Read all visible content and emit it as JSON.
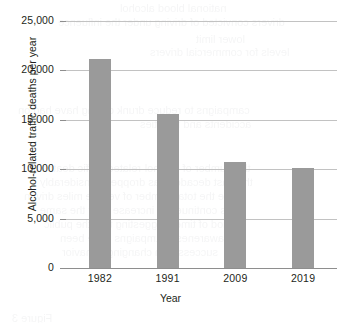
{
  "chart_data": {
    "type": "bar",
    "title": "",
    "subtitle": "",
    "xlabel": "Year",
    "ylabel": "Alcohol-related traffic deaths per year",
    "categories": [
      "1982",
      "1991",
      "2009",
      "2019"
    ],
    "values": [
      21150,
      15550,
      10750,
      10100
    ],
    "series": [
      {
        "name": "Alcohol-related traffic deaths per year",
        "values": [
          21150,
          15550,
          10750,
          10100
        ]
      }
    ],
    "ylim": [
      0,
      25000
    ],
    "ytick_values": [
      0,
      5000,
      10000,
      15000,
      20000,
      25000
    ],
    "ytick_labels": [
      "0",
      "5,000",
      "10,000",
      "15,000",
      "20,000",
      "25,000"
    ],
    "grid": true,
    "grid_axis": "y",
    "legend": false,
    "legend_position": "none",
    "bar_color": "#9a9a9a",
    "grid_color": "#c2c2c2",
    "axis_color": "#8e8e8e",
    "text_color": "#231f20",
    "background": "#ffffff"
  },
  "page_bleed": {
    "note": "faint mirrored show-through text from reverse side of the printed page",
    "lines": [
      {
        "text": "national blood alcohol",
        "x": 120,
        "y": 2,
        "size": 11
      },
      {
        "text": "drivers convicted of driving under the influence",
        "x": 58,
        "y": 16,
        "size": 11
      },
      {
        "text": "lower limit",
        "x": 196,
        "y": 33,
        "size": 11
      },
      {
        "text": "levels for commercial drivers",
        "x": 150,
        "y": 46,
        "size": 11
      },
      {
        "text": "campaigns to reduce drunk driving have had on",
        "x": 18,
        "y": 104,
        "size": 11
      },
      {
        "text": "accidents and fatalities",
        "x": 140,
        "y": 118,
        "size": 11
      },
      {
        "text": "the number of alcohol-related traffic deaths in",
        "x": 30,
        "y": 162,
        "size": 11
      },
      {
        "text": "the past decades has dropped considerably",
        "x": 40,
        "y": 176,
        "size": 11
      },
      {
        "text": "while the total number of vehicle miles driven",
        "x": 24,
        "y": 190,
        "size": 11
      },
      {
        "text": "has continued to increase over the same",
        "x": 40,
        "y": 204,
        "size": 11
      },
      {
        "text": "period of time, suggesting that the public",
        "x": 44,
        "y": 218,
        "size": 11
      },
      {
        "text": "awareness campaigns have been",
        "x": 60,
        "y": 232,
        "size": 11
      },
      {
        "text": "successful in changing behavior",
        "x": 62,
        "y": 246,
        "size": 11
      },
      {
        "text": "Figure 3",
        "x": 12,
        "y": 312,
        "size": 11
      }
    ]
  }
}
